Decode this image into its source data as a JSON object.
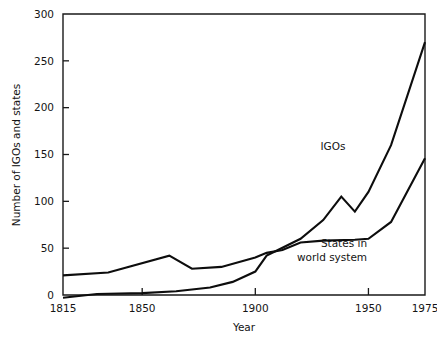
{
  "chart_data": {
    "type": "line",
    "title": "",
    "xlabel": "Year",
    "ylabel": "Number of IGOs and states",
    "xlim": [
      1815,
      1975
    ],
    "ylim": [
      0,
      300
    ],
    "xticks": [
      1815,
      1850,
      1900,
      1950,
      1975
    ],
    "xtick_labels": [
      "1815",
      "1850",
      "1900",
      "1950",
      "1975"
    ],
    "yticks": [
      0,
      50,
      100,
      150,
      200,
      250,
      300
    ],
    "ytick_labels": [
      "0",
      "50",
      "100",
      "150",
      "200",
      "250",
      "300"
    ],
    "grid": false,
    "legend_position": "inline-annotations",
    "series": [
      {
        "name": "IGOs",
        "label": "IGOs",
        "label_lines": [
          "IGOs"
        ],
        "color": "#0d0d0d",
        "x": [
          1815,
          1830,
          1850,
          1865,
          1880,
          1890,
          1900,
          1905,
          1910,
          1920,
          1930,
          1938,
          1944,
          1950,
          1960,
          1975
        ],
        "y": [
          -3,
          1,
          2,
          4,
          8,
          14,
          25,
          42,
          48,
          60,
          80,
          105,
          89,
          110,
          160,
          270
        ]
      },
      {
        "name": "States in world system",
        "label": "States in world system",
        "label_lines": [
          "States in",
          "world system"
        ],
        "color": "#0d0d0d",
        "x": [
          1815,
          1835,
          1862,
          1872,
          1885,
          1900,
          1905,
          1912,
          1920,
          1930,
          1944,
          1950,
          1960,
          1975
        ],
        "y": [
          21,
          24,
          42,
          28,
          30,
          40,
          45,
          48,
          56,
          58,
          59,
          60,
          78,
          146
        ]
      }
    ],
    "annotations": [
      {
        "text": "IGOs",
        "x_px": 333,
        "y_px": 150
      },
      {
        "text": "States in",
        "x_px": 344,
        "y_px": 247
      },
      {
        "text": "world system",
        "x_px": 332,
        "y_px": 261
      }
    ]
  },
  "axes": {
    "x_title": "Year",
    "y_title": "Number of IGOs and states"
  }
}
